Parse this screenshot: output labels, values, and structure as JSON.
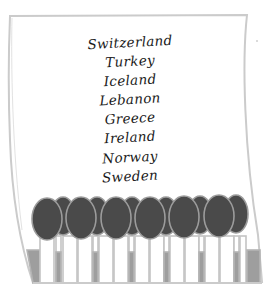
{
  "poster": {
    "type": "tear-off-flyer",
    "countries": [
      "Switzerland",
      "Turkey",
      "Iceland",
      "Lebanon",
      "Greece",
      "Ireland",
      "Norway",
      "Sweden"
    ],
    "tab_count": 13,
    "colors": {
      "paper": "#ffffff",
      "outline": "#c8c8c8",
      "oval_fill": "#4a4a4a",
      "oval_stroke": "#9a9a9a",
      "tab_bar": "#9e9e9e",
      "text": "#1a1a1a"
    }
  }
}
